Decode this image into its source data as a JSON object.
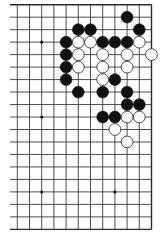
{
  "board": {
    "description": "Go board fragment showing right portion of a 19x19 board (12 columns x 19 rows visible)",
    "visible_columns": 12,
    "visible_rows": 19,
    "geometry": {
      "x0": 17.3,
      "dx": 12.2,
      "y0": 4.7,
      "dy": 12.48,
      "left_stub_x": 10,
      "stone_radius": 5.9
    },
    "edges": {
      "top": true,
      "bottom": true,
      "right": true,
      "left": false
    },
    "hoshi": [
      [
        2,
        3
      ],
      [
        8,
        3
      ],
      [
        2,
        9
      ],
      [
        8,
        9
      ],
      [
        2,
        15
      ],
      [
        8,
        15
      ]
    ],
    "stones": [
      {
        "color": "black",
        "col": 9,
        "row": 1
      },
      {
        "color": "black",
        "col": 5,
        "row": 2
      },
      {
        "color": "black",
        "col": 6,
        "row": 2
      },
      {
        "color": "black",
        "col": 10,
        "row": 2
      },
      {
        "color": "black",
        "col": 4,
        "row": 3
      },
      {
        "color": "white",
        "col": 5,
        "row": 3
      },
      {
        "color": "white",
        "col": 6,
        "row": 3
      },
      {
        "color": "black",
        "col": 7,
        "row": 3
      },
      {
        "color": "black",
        "col": 8,
        "row": 3
      },
      {
        "color": "black",
        "col": 9,
        "row": 3
      },
      {
        "color": "white",
        "col": 10,
        "row": 3
      },
      {
        "color": "black",
        "col": 4,
        "row": 4
      },
      {
        "color": "white",
        "col": 5,
        "row": 4
      },
      {
        "color": "white",
        "col": 7,
        "row": 4
      },
      {
        "color": "white",
        "col": 9,
        "row": 4
      },
      {
        "color": "white",
        "col": 11,
        "row": 4
      },
      {
        "color": "black",
        "col": 4,
        "row": 5
      },
      {
        "color": "white",
        "col": 5,
        "row": 5
      },
      {
        "color": "white",
        "col": 7,
        "row": 5
      },
      {
        "color": "white",
        "col": 9,
        "row": 5
      },
      {
        "color": "black",
        "col": 4,
        "row": 6
      },
      {
        "color": "white",
        "col": 7,
        "row": 6
      },
      {
        "color": "black",
        "col": 8,
        "row": 6
      },
      {
        "color": "black",
        "col": 5,
        "row": 7
      },
      {
        "color": "black",
        "col": 7,
        "row": 7
      },
      {
        "color": "black",
        "col": 9,
        "row": 7
      },
      {
        "color": "black",
        "col": 9,
        "row": 8
      },
      {
        "color": "black",
        "col": 10,
        "row": 8
      },
      {
        "color": "black",
        "col": 7,
        "row": 9
      },
      {
        "color": "black",
        "col": 8,
        "row": 9
      },
      {
        "color": "white",
        "col": 9,
        "row": 9
      },
      {
        "color": "white",
        "col": 10,
        "row": 9
      },
      {
        "color": "white",
        "col": 8,
        "row": 10
      },
      {
        "color": "white",
        "col": 9,
        "row": 11
      }
    ],
    "colors": {
      "background": "#ffffff",
      "line": "#3a3a3a",
      "black_stone": "#111111",
      "white_stone": "#ffffff",
      "white_stone_outline": "#222222"
    }
  }
}
